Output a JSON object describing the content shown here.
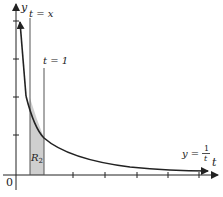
{
  "diagram": {
    "type": "function-graph",
    "function": "y = 1/t",
    "axes": {
      "x_label": "t",
      "y_label": "y",
      "origin_label": "0"
    },
    "labels": {
      "vline_x": "t = x",
      "vline_one": "t = 1",
      "region": "R",
      "region_sub": "2",
      "curve_lhs": "y =",
      "curve_num": "1",
      "curve_den": "t"
    },
    "colors": {
      "line": "#222222",
      "shade": "#cfcfcf"
    }
  }
}
